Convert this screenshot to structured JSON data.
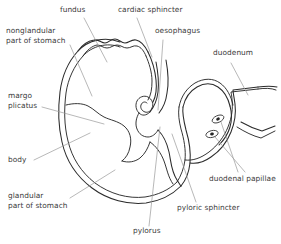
{
  "figure": {
    "background_color": "#ffffff",
    "outline_color": "#2b2b2b",
    "leader_color": "#9a9a9a",
    "label_color": "#3a3a3a"
  },
  "labels": {
    "fundus": "fundus",
    "cardiac_sphincter": "cardiac sphincter",
    "oesophagus": "oesophagus",
    "duodenum": "duodenum",
    "nonglandular_line1": "nonglandular",
    "nonglandular_line2": "part of stomach",
    "margo_line1": "margo",
    "margo_line2": "plicatus",
    "body": "body",
    "glandular_line1": "glandular",
    "glandular_line2": "part of stomach",
    "duodenal_papillae": "duodenal papillae",
    "pyloric_sphincter": "pyloric sphincter",
    "pylorus": "pylorus"
  },
  "structures": [
    {
      "name": "fundus",
      "kind": "region"
    },
    {
      "name": "cardiac-sphincter",
      "kind": "sphincter"
    },
    {
      "name": "oesophagus",
      "kind": "tube"
    },
    {
      "name": "duodenum",
      "kind": "tube"
    },
    {
      "name": "nonglandular-part-of-stomach",
      "kind": "region"
    },
    {
      "name": "margo-plicatus",
      "kind": "boundary-line"
    },
    {
      "name": "body",
      "kind": "region"
    },
    {
      "name": "glandular-part-of-stomach",
      "kind": "region"
    },
    {
      "name": "duodenal-papillae",
      "kind": "papilla",
      "count": 2
    },
    {
      "name": "pyloric-sphincter",
      "kind": "sphincter"
    },
    {
      "name": "pylorus",
      "kind": "region"
    }
  ]
}
